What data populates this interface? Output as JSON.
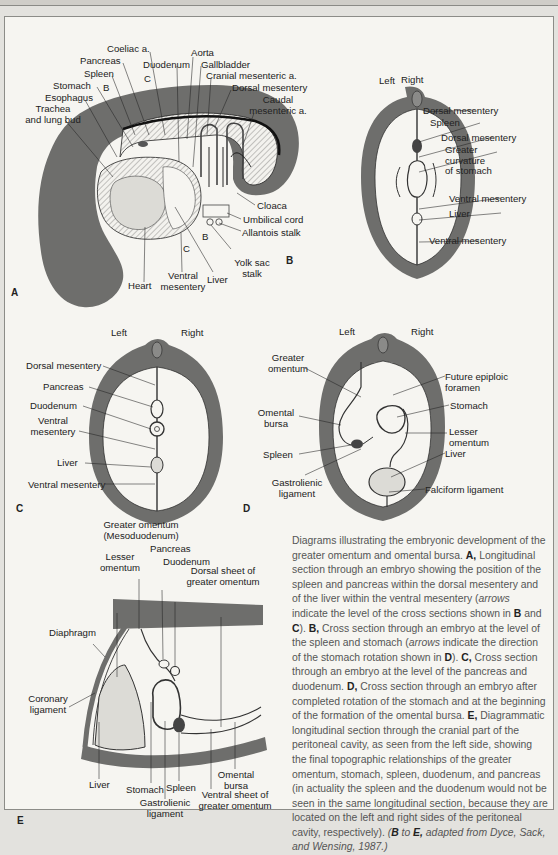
{
  "figure": {
    "panels": {
      "A": {
        "letter": "A",
        "labels": {
          "coeliac": "Coeliac a.",
          "aorta": "Aorta",
          "pancreas": "Pancreas",
          "duodenum": "Duodenum",
          "gallbladder": "Gallbladder",
          "spleen": "Spleen",
          "arrow_c": "C",
          "cranial_mes": "Cranial mesenteric a.",
          "stomach": "Stomach",
          "arrow_b": "B",
          "dorsal_mes": "Dorsal mesentery",
          "esophagus": "Esophagus",
          "caudal_mes_1": "Caudal",
          "caudal_mes_2": "mesenteric a.",
          "trachea_1": "Trachea",
          "trachea_2": "and lung bud",
          "cloaca": "Cloaca",
          "umbilical": "Umbilical cord",
          "arrow_b2": "B",
          "allantois": "Allantois stalk",
          "arrow_c2": "C",
          "yolk_1": "Yolk sac",
          "yolk_2": "stalk",
          "heart": "Heart",
          "ventral_1": "Ventral",
          "ventral_2": "mesentery",
          "liver": "Liver"
        }
      },
      "B": {
        "letter": "B",
        "labels": {
          "left": "Left",
          "right": "Right",
          "dorsal_mes": "Dorsal mesentery",
          "spleen": "Spleen",
          "dorsal_mes2": "Dorsal mesentery",
          "greater_1": "Greater",
          "greater_2": "curvature",
          "greater_3": "of stomach",
          "ventral_mes": "Ventral mesentery",
          "liver": "Liver",
          "ventral_mes2": "Ventral mesentery"
        }
      },
      "C": {
        "letter": "C",
        "labels": {
          "left": "Left",
          "right": "Right",
          "dorsal_mes": "Dorsal mesentery",
          "pancreas": "Pancreas",
          "duodenum": "Duodenum",
          "ventral_1": "Ventral",
          "ventral_2": "mesentery",
          "liver": "Liver",
          "ventral_mes2": "Ventral mesentery"
        }
      },
      "D": {
        "letter": "D",
        "labels": {
          "left": "Left",
          "right": "Right",
          "greater_1": "Greater",
          "greater_2": "omentum",
          "future_1": "Future epiploic",
          "future_2": "foramen",
          "omental_1": "Omental",
          "omental_2": "bursa",
          "stomach": "Stomach",
          "lesser_1": "Lesser",
          "lesser_2": "omentum",
          "spleen": "Spleen",
          "liver": "Liver",
          "gastro_1": "Gastrolienic",
          "gastro_2": "ligament",
          "falciform": "Falciform ligament"
        }
      },
      "E": {
        "letter": "E",
        "labels": {
          "greater_1": "Greater omentum",
          "greater_2": "(Mesoduodenum)",
          "pancreas": "Pancreas",
          "lesser_1": "Lesser",
          "lesser_2": "omentum",
          "duodenum": "Duodenum",
          "dorsal_1": "Dorsal sheet of",
          "dorsal_2": "greater omentum",
          "diaphragm": "Diaphragm",
          "coronary_1": "Coronary",
          "coronary_2": "ligament",
          "omental_1": "Omental",
          "omental_2": "bursa",
          "liver": "Liver",
          "stomach": "Stomach",
          "spleen": "Spleen",
          "ventral_1": "Ventral sheet of",
          "ventral_2": "greater omentum",
          "gastro_1": "Gastrolienic",
          "gastro_2": "ligament"
        }
      }
    },
    "caption": {
      "intro": "Diagrams illustrating the embryonic development of the greater omentum and omental bursa.",
      "a_letter": "A,",
      "a_text": "Longitudinal section through an embryo showing the position of the spleen and pancreas within the dorsal mesentery and of the liver within the ventral mesentery (",
      "a_arrows": "arrows",
      "a_text2": "indicate the level of the cross sections shown in",
      "a_b": "B",
      "a_and": "and",
      "a_c": "C",
      "a_close": ").",
      "b_letter": "B,",
      "b_text": "Cross section through an embryo at the level of the spleen and stomach (",
      "b_arrows": "arrows",
      "b_text2": "indicate the direction of the stomach rotation shown in",
      "b_d": "D",
      "b_close": ").",
      "c_letter": "C,",
      "c_text": "Cross section through an embryo at the level of the pancreas and duodenum.",
      "d_letter": "D,",
      "d_text": "Cross section through an embryo after completed rotation of the stomach and at the beginning of the formation of the omental bursa.",
      "e_letter": "E,",
      "e_text": "Diagrammatic longitudinal section through the cranial part of the peritoneal cavity, as seen from the left side, showing the final topographic relationships of the greater omentum, stomach, spleen, duodenum, and pancreas (in actuality the spleen and the duodenum would not be seen in the same longitudinal section, because they are located on the left and right sides of the peritoneal cavity, respectively).",
      "source_b": "B",
      "source_to": "to",
      "source_e": "E,",
      "source_text": "adapted from Dyce, Sack, and Wensing, 1987.)",
      "source_open": "("
    },
    "colors": {
      "wall": "#6e6e6c",
      "organ_fill": "#dcdbd6",
      "page": "#f6f5f1",
      "caption_text": "#555555"
    }
  }
}
